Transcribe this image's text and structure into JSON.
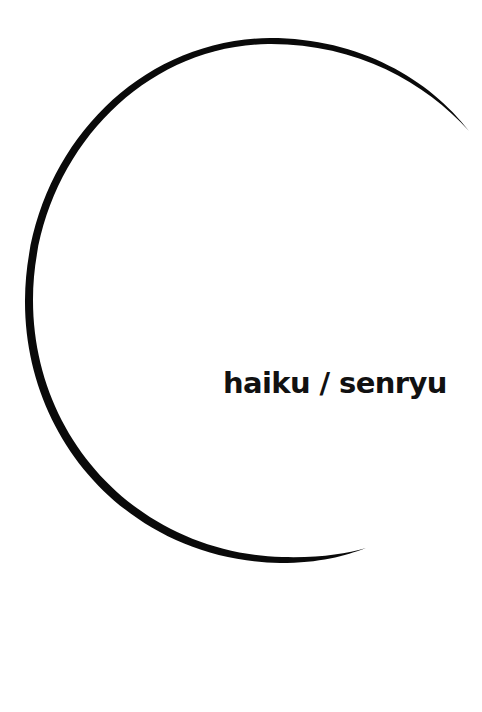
{
  "cover": {
    "title": "haiku / senryu",
    "background_color": "#ffffff",
    "ink_color": "#0a0a0a",
    "enso": {
      "type": "brush-stroke-arc",
      "center": [
        287,
        300
      ],
      "radius": 261,
      "start_point": [
        468,
        130
      ],
      "end_point": [
        366,
        548
      ],
      "max_stroke_width": 9
    }
  }
}
